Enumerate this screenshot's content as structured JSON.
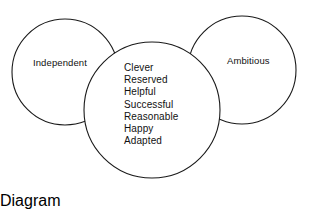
{
  "diagram": {
    "type": "three-circle-overlap-diagram",
    "background_color": "#ffffff",
    "stroke_color": "#1a1a1a",
    "left_circle": {
      "label": "Independent",
      "center_x": 65,
      "center_y": 72,
      "radius": 53
    },
    "right_circle": {
      "label": "Ambitious",
      "center_x": 242,
      "center_y": 70,
      "radius": 54
    },
    "center_circle": {
      "center_x": 152,
      "center_y": 110,
      "radius": 68,
      "items": [
        "Clever",
        "Reserved",
        "Helpful",
        "Successful",
        "Reasonable",
        "Happy",
        "Adapted"
      ]
    }
  }
}
